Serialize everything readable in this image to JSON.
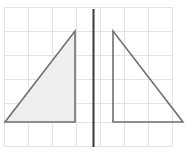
{
  "figure": {
    "canvas": {
      "width": 187,
      "height": 151
    },
    "background_color": "#ffffff",
    "grid": {
      "visible": true,
      "line_color": "#e3e3e6",
      "line_width": 1,
      "cell_size": 24,
      "origin_x": 4,
      "origin_y": 7,
      "x_lines": [
        4,
        28,
        52,
        76,
        100,
        124,
        148,
        172
      ],
      "y_lines": [
        7,
        31,
        55,
        79,
        103,
        122,
        146
      ],
      "columns": 7,
      "rows": 6
    },
    "mirror_line": {
      "name": "line-of-reflection",
      "color": "#3a3a3a",
      "width": 2,
      "x": 93,
      "y_start": 9,
      "y_end": 147,
      "orientation": "vertical"
    },
    "shapes": [
      {
        "id": "left-triangle",
        "label": "pre-image",
        "fill": "#eeeeee",
        "stroke": "#6f6f6f",
        "stroke_width": 1.6,
        "filled": true,
        "points": [
          {
            "x": 5,
            "y": 122
          },
          {
            "x": 75,
            "y": 122
          },
          {
            "x": 75,
            "y": 31
          }
        ],
        "points_text": "(5,122) (75,122) (75,31)"
      },
      {
        "id": "right-triangle",
        "label": "image",
        "fill": "#ffffff",
        "stroke": "#6f6f6f",
        "stroke_width": 1.6,
        "filled": false,
        "points": [
          {
            "x": 113,
            "y": 31
          },
          {
            "x": 113,
            "y": 122
          },
          {
            "x": 183,
            "y": 122
          }
        ],
        "points_text": "(113,31) (113,122) (183,122)"
      }
    ]
  }
}
